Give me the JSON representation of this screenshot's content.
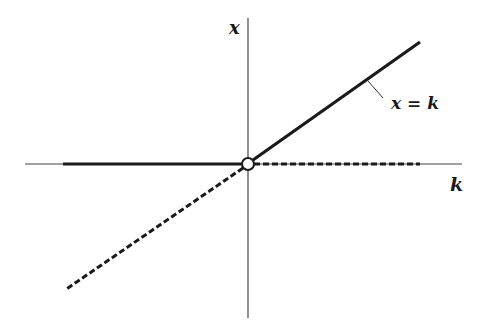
{
  "diagram": {
    "axes": {
      "vertical_label": "x",
      "horizontal_label": "k"
    },
    "curves": {
      "stable_branch_label": "x = k",
      "description": "Transcritical bifurcation: solid = stable, dashed = unstable"
    },
    "colors": {
      "line": "#1a1a1a",
      "axis": "#444444",
      "background": "#ffffff"
    }
  }
}
